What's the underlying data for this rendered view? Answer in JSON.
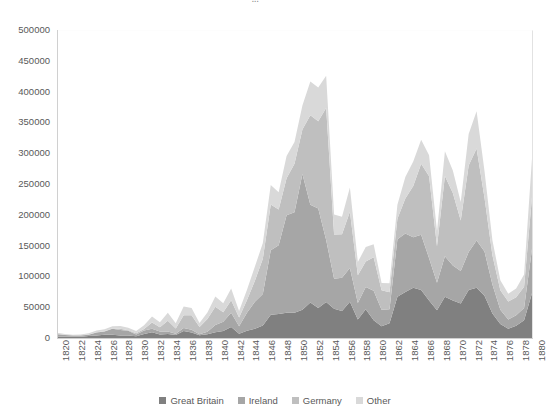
{
  "chart_data": {
    "type": "area",
    "stacked": true,
    "title": "",
    "xlabel": "",
    "ylabel": "",
    "ylim": [
      0,
      500000
    ],
    "ytick_step": 50000,
    "ytick_labels": [
      "500000",
      "450000",
      "400000",
      "350000",
      "300000",
      "250000",
      "200000",
      "150000",
      "100000",
      "50000",
      "0"
    ],
    "ytick_values": [
      500000,
      450000,
      400000,
      350000,
      300000,
      250000,
      200000,
      150000,
      100000,
      50000,
      0
    ],
    "grid": false,
    "legend_position": "bottom",
    "x": [
      1820,
      1821,
      1822,
      1823,
      1824,
      1825,
      1826,
      1827,
      1828,
      1829,
      1830,
      1831,
      1832,
      1833,
      1834,
      1835,
      1836,
      1837,
      1838,
      1839,
      1840,
      1841,
      1842,
      1843,
      1844,
      1845,
      1846,
      1847,
      1848,
      1849,
      1850,
      1851,
      1852,
      1853,
      1854,
      1855,
      1856,
      1857,
      1858,
      1859,
      1860,
      1861,
      1862,
      1863,
      1864,
      1865,
      1866,
      1867,
      1868,
      1869,
      1870,
      1871,
      1872,
      1873,
      1874,
      1875,
      1876,
      1877,
      1878,
      1879,
      1880
    ],
    "xtick_labels": [
      "1820",
      "1822",
      "1824",
      "1826",
      "1828",
      "1830",
      "1832",
      "1834",
      "1836",
      "1838",
      "1840",
      "1842",
      "1844",
      "1846",
      "1848",
      "1850",
      "1852",
      "1854",
      "1856",
      "1858",
      "1860",
      "1862",
      "1864",
      "1866",
      "1868",
      "1870",
      "1872",
      "1874",
      "1876",
      "1878",
      "1880"
    ],
    "series": [
      {
        "name": "Great Britain",
        "color": "#808080",
        "values": [
          2410,
          2060,
          1950,
          2200,
          3100,
          4200,
          5200,
          5400,
          4100,
          4000,
          3000,
          6500,
          9200,
          5600,
          6400,
          5000,
          11200,
          9000,
          4600,
          6000,
          9300,
          11500,
          18000,
          7000,
          12000,
          15000,
          20500,
          38000,
          39000,
          41000,
          41000,
          46000,
          58000,
          49000,
          58500,
          47500,
          44000,
          59000,
          30000,
          47000,
          29000,
          19000,
          24000,
          67000,
          75000,
          82000,
          78000,
          61000,
          45000,
          67000,
          61000,
          56000,
          78000,
          82000,
          69000,
          40000,
          23000,
          15000,
          20000,
          29000,
          73000
        ],
        "unit": "immigrants"
      },
      {
        "name": "Ireland",
        "color": "#a6a6a6",
        "values": [
          3614,
          3000,
          2267,
          1908,
          2345,
          4888,
          5408,
          9766,
          9000,
          8000,
          2721,
          5772,
          6000,
          5000,
          4000,
          2000,
          5000,
          4500,
          1500,
          4000,
          12000,
          15000,
          23000,
          12000,
          29000,
          44000,
          51000,
          105000,
          112000,
          159000,
          164000,
          221000,
          159000,
          162000,
          101000,
          49000,
          54000,
          55000,
          27000,
          36000,
          48000,
          27000,
          23000,
          94000,
          95000,
          82000,
          90000,
          69000,
          45000,
          66000,
          57000,
          53000,
          62000,
          77000,
          72000,
          47000,
          23000,
          15000,
          17000,
          20000,
          72000
        ],
        "unit": "immigrants"
      },
      {
        "name": "Germany",
        "color": "#bfbfbf",
        "values": [
          968,
          383,
          148,
          183,
          230,
          450,
          511,
          432,
          1851,
          597,
          1976,
          2413,
          10194,
          6988,
          17686,
          8311,
          20707,
          23740,
          11683,
          21028,
          29704,
          15291,
          20370,
          14441,
          20731,
          34355,
          57561,
          74281,
          58465,
          60235,
          78896,
          72482,
          145918,
          141946,
          215009,
          71918,
          71028,
          91781,
          45310,
          41784,
          54491,
          31661,
          27529,
          33162,
          57276,
          83424,
          115892,
          133426,
          59592,
          131042,
          118225,
          82554,
          141109,
          149671,
          87270,
          47769,
          31937,
          29298,
          29313,
          34602,
          84638
        ],
        "unit": "immigrants"
      },
      {
        "name": "Other",
        "color": "#d9d9d9",
        "values": [
          1393,
          1226,
          1050,
          1320,
          1880,
          2560,
          3140,
          3680,
          4460,
          4100,
          3520,
          6100,
          9600,
          7900,
          13200,
          8600,
          14400,
          11800,
          6600,
          10400,
          16600,
          14900,
          19200,
          10600,
          16900,
          22900,
          25600,
          31800,
          27900,
          36000,
          35500,
          39100,
          54900,
          55200,
          52700,
          32800,
          28400,
          39500,
          21500,
          23300,
          21000,
          11900,
          14800,
          22900,
          34800,
          40200,
          38900,
          34400,
          24500,
          40100,
          36500,
          29900,
          51300,
          60600,
          43900,
          24500,
          16200,
          12800,
          14500,
          19800,
          62500
        ],
        "unit": "immigrants"
      }
    ]
  },
  "legend": {
    "items": [
      {
        "label": "Great Britain",
        "color": "#808080"
      },
      {
        "label": "Ireland",
        "color": "#a6a6a6"
      },
      {
        "label": "Germany",
        "color": "#bfbfbf"
      },
      {
        "label": "Other",
        "color": "#d9d9d9"
      }
    ]
  },
  "title_remnant": "..."
}
